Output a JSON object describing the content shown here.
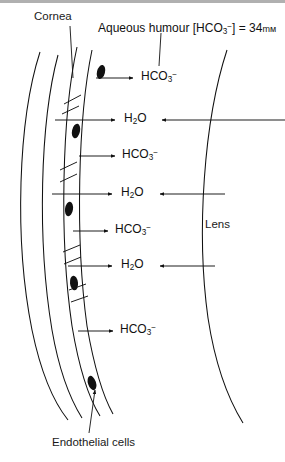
{
  "figure": {
    "title_labels": {
      "cornea": "Cornea",
      "aqueous_prefix": "Aqueous humour [HCO",
      "aqueous_sub": "3",
      "aqueous_sup": "−",
      "aqueous_mid": "] = 34",
      "aqueous_units": "mᴍ",
      "lens": "Lens",
      "endothelial": "Endothelial cells"
    },
    "transport_rows": [
      {
        "species": "HCO3-",
        "text_main": "HCO",
        "sub": "3",
        "sup": "−",
        "direction": "out",
        "y": 78
      },
      {
        "species": "H2O",
        "text_main": "H",
        "sub": "2",
        "sup": "O",
        "direction": "both",
        "y": 120
      },
      {
        "species": "HCO3-",
        "text_main": "HCO",
        "sub": "3",
        "sup": "−",
        "direction": "out",
        "y": 156
      },
      {
        "species": "H2O",
        "text_main": "H",
        "sub": "2",
        "sup": "O",
        "direction": "both",
        "y": 194
      },
      {
        "species": "HCO3-",
        "text_main": "HCO",
        "sub": "3",
        "sup": "−",
        "direction": "out",
        "y": 231
      },
      {
        "species": "H2O",
        "text_main": "H",
        "sub": "2",
        "sup": "O",
        "direction": "both",
        "y": 266
      },
      {
        "species": "HCO3-",
        "text_main": "HCO",
        "sub": "3",
        "sup": "−",
        "direction": "out",
        "y": 331
      }
    ],
    "colors": {
      "ink": "#111111",
      "paper": "#ffffff",
      "band": "#6f6f6f"
    },
    "structures": {
      "cornea_stroma": "two concentric arcs, convex left",
      "endothelium": "narrow band with diagonal cell borders and dark oval nuclei",
      "lens": "single arc at right, convex left"
    }
  }
}
